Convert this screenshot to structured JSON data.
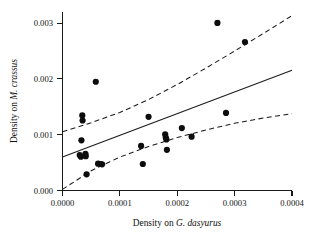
{
  "chart_data": {
    "type": "scatter",
    "title": "",
    "xlabel": "Density on G. dasyurus",
    "ylabel": "Density on M. crassus",
    "xlabel_prefix": "Density on ",
    "xlabel_species": "G. dasyurus",
    "ylabel_prefix": "Density on ",
    "ylabel_species": "M. crassus",
    "xlim": [
      0.0,
      0.0004
    ],
    "ylim": [
      0.0,
      0.0032
    ],
    "xticks": [
      0.0,
      0.0001,
      0.0002,
      0.0003,
      0.0004
    ],
    "yticks": [
      0.0,
      0.001,
      0.002,
      0.003
    ],
    "xticklabels": [
      "0.0000",
      "0.0001",
      "0.0002",
      "0.0003",
      "0.0004"
    ],
    "yticklabels": [
      "0.000",
      "0.001",
      "0.002",
      "0.003"
    ],
    "grid": false,
    "legend": false,
    "marker": "filled-circle",
    "marker_color": "#0d0d0d",
    "line_color": "#1a1a1a",
    "points": [
      {
        "x": 3e-05,
        "y": 0.000635
      },
      {
        "x": 3.2e-05,
        "y": 0.000605
      },
      {
        "x": 3.3e-05,
        "y": 0.0009
      },
      {
        "x": 3.45e-05,
        "y": 0.001345
      },
      {
        "x": 3.5e-05,
        "y": 0.001255
      },
      {
        "x": 4e-05,
        "y": 0.000655
      },
      {
        "x": 4.05e-05,
        "y": 0.000615
      },
      {
        "x": 4.2e-05,
        "y": 0.00029
      },
      {
        "x": 5.8e-05,
        "y": 0.00195
      },
      {
        "x": 6.2e-05,
        "y": 0.00048
      },
      {
        "x": 6.6e-05,
        "y": 0.000475
      },
      {
        "x": 6.9e-05,
        "y": 0.00047
      },
      {
        "x": 0.000137,
        "y": 0.0008
      },
      {
        "x": 0.00014,
        "y": 0.000475
      },
      {
        "x": 0.00015,
        "y": 0.00132
      },
      {
        "x": 0.000179,
        "y": 0.001005
      },
      {
        "x": 0.00018,
        "y": 0.00095
      },
      {
        "x": 0.000181,
        "y": 0.000915
      },
      {
        "x": 0.000182,
        "y": 0.00073
      },
      {
        "x": 0.000208,
        "y": 0.00112
      },
      {
        "x": 0.000225,
        "y": 0.000965
      },
      {
        "x": 0.00027,
        "y": 0.003005
      },
      {
        "x": 0.000285,
        "y": 0.00139
      },
      {
        "x": 0.000318,
        "y": 0.00266
      }
    ],
    "fit_line": {
      "name": "regression line",
      "style": "solid",
      "points": [
        {
          "x": 0.0,
          "y": 0.0006
        },
        {
          "x": 0.0004,
          "y": 0.002155
        }
      ]
    },
    "confidence_bands": [
      {
        "name": "upper 95% confidence band",
        "style": "dashed",
        "points": [
          {
            "x": 0.0,
            "y": 0.001055
          },
          {
            "x": 5e-05,
            "y": 0.001215
          },
          {
            "x": 0.0001,
            "y": 0.0014
          },
          {
            "x": 0.00015,
            "y": 0.00163
          },
          {
            "x": 0.0002,
            "y": 0.0019
          },
          {
            "x": 0.00025,
            "y": 0.002195
          },
          {
            "x": 0.0003,
            "y": 0.0025
          },
          {
            "x": 0.00035,
            "y": 0.002815
          },
          {
            "x": 0.0004,
            "y": 0.003135
          }
        ]
      },
      {
        "name": "lower 95% confidence band",
        "style": "dashed",
        "points": [
          {
            "x": 0.0,
            "y": 2e-05
          },
          {
            "x": 5e-05,
            "y": 0.000355
          },
          {
            "x": 0.0001,
            "y": 0.0006
          },
          {
            "x": 0.00015,
            "y": 0.00079
          },
          {
            "x": 0.0002,
            "y": 0.00095
          },
          {
            "x": 0.00025,
            "y": 0.001085
          },
          {
            "x": 0.0003,
            "y": 0.001205
          },
          {
            "x": 0.00035,
            "y": 0.0013
          },
          {
            "x": 0.0004,
            "y": 0.001375
          }
        ]
      }
    ]
  }
}
